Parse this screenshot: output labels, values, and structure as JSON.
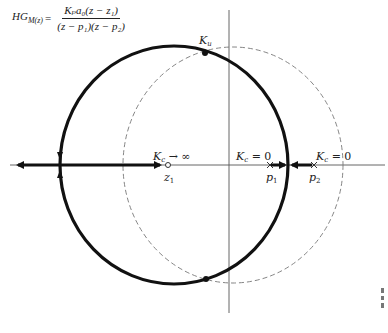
{
  "formula": {
    "lhs": "HG",
    "lhs_sub": "M(z)",
    "equals": "=",
    "numerator": "Kₚa₀(z − z₁)",
    "denominator": "(z − p₁)(z − p₂)"
  },
  "labels": {
    "ku": "K",
    "ku_sub": "u",
    "kc_inf": "K",
    "kc_inf_sub": "c",
    "kc_inf_tail": " → ∞",
    "kc_zero_1": "K",
    "kc_zero_1_sub": "c",
    "kc_zero_1_tail": " = 0",
    "kc_zero_2": "K",
    "kc_zero_2_sub": "c",
    "kc_zero_2_tail": " = 0",
    "z1": "z",
    "z1_sub": "1",
    "p1": "p",
    "p1_sub": "1",
    "p2": "p",
    "p2_sub": "2"
  },
  "colors": {
    "locus": "#111111",
    "axis": "#555555",
    "unit_circle": "#777777"
  }
}
